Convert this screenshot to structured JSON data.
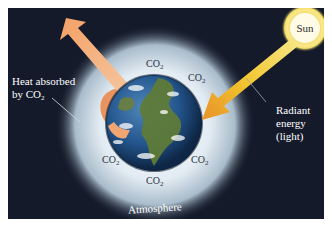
{
  "diagram": {
    "labels": {
      "sun": "Sun",
      "heat_absorbed_line1": "Heat absorbed",
      "heat_absorbed_line2_prefix": "by CO",
      "heat_absorbed_line2_sub": "2",
      "radiant_line1": "Radiant",
      "radiant_line2": "energy",
      "radiant_line3": "(light)",
      "atmosphere": "Atmosphere"
    },
    "co2_molecules": [
      {
        "id": "top",
        "text": "CO",
        "sub": "2"
      },
      {
        "id": "upper-right",
        "text": "CO",
        "sub": "2"
      },
      {
        "id": "lower-left",
        "text": "CO",
        "sub": "2"
      },
      {
        "id": "lower-right",
        "text": "CO",
        "sub": "2"
      },
      {
        "id": "bottom",
        "text": "CO",
        "sub": "2"
      }
    ],
    "colors": {
      "background": "#141a2a",
      "border": "#ffffff",
      "atmosphere_glow": "#dfe9f2",
      "sun": "#fff6c8",
      "radiant_arrow": "#f2c22e",
      "heat_arrow": "#f0a572",
      "ocean": "#1f4f86",
      "land": "#5e7a3a"
    },
    "icons": [
      "sun-icon",
      "earth-icon",
      "radiant-energy-arrow-icon",
      "heat-arrow-icon"
    ]
  }
}
